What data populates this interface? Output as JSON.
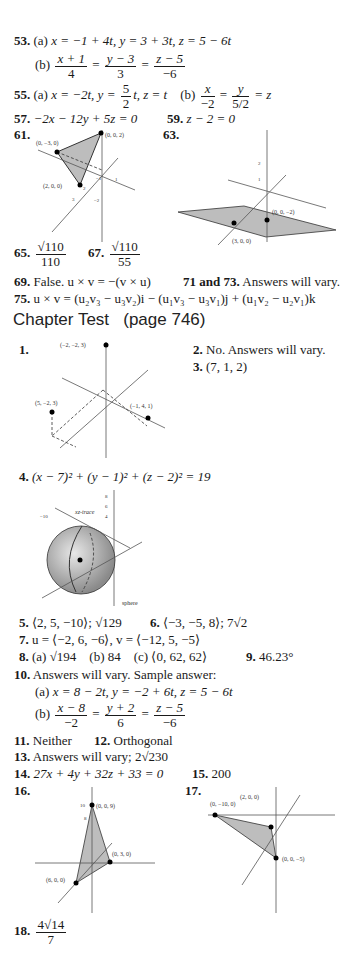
{
  "answers": {
    "a53": {
      "num": "53.",
      "a_label": "(a)",
      "a_text": "x = −1 + 4t,  y = 3 + 3t,  z = 5 − 6t",
      "b_label": "(b)",
      "b_fracs": [
        {
          "n": "x + 1",
          "d": "4"
        },
        {
          "n": "y − 3",
          "d": "3"
        },
        {
          "n": "z − 5",
          "d": "−6"
        }
      ]
    },
    "a55": {
      "num": "55.",
      "a_label": "(a)",
      "a_text1": "x = −2t,  y = ",
      "a_frac": {
        "n": "5",
        "d": "2"
      },
      "a_text2": "t,  z = t",
      "b_label": "(b)",
      "b_fracs": [
        {
          "n": "x",
          "d": "−2"
        },
        {
          "n": "y",
          "d": "5/2"
        }
      ],
      "b_tail": "= z"
    },
    "a57": {
      "num": "57.",
      "text": "−2x − 12y + 5z = 0"
    },
    "a59": {
      "num": "59.",
      "text": "z − 2 = 0"
    },
    "a61": {
      "num": "61.",
      "points": [
        "(0, −3, 0)",
        "(0, 0, 2)",
        "(2, 0, 0)"
      ],
      "ticks": [
        "1",
        "1",
        "−1",
        "2",
        "3",
        "−2"
      ]
    },
    "a63": {
      "num": "63.",
      "points": [
        "(0, 0, −2)",
        "(3, 0, 0)"
      ],
      "ticks": [
        "2",
        "1",
        "−2",
        "−1",
        "1",
        "1",
        "2",
        "−1",
        "3",
        "−2",
        "3",
        "4"
      ]
    },
    "a65": {
      "num": "65.",
      "n": "√110",
      "d": "110"
    },
    "a67": {
      "num": "67.",
      "n": "√110",
      "d": "55"
    },
    "a69": {
      "num": "69.",
      "text": "False. u × v = −(v × u)"
    },
    "a71": {
      "num": "71 and 73.",
      "text": "Answers will vary."
    },
    "a75": {
      "num": "75.",
      "text": "u × v = (u₂v₃ − u₃v₂)i − (u₁v₃ − u₃v₁)j + (u₁v₂ − u₂v₁)k"
    }
  },
  "chapter_test": {
    "heading": "Chapter Test",
    "page_ref": "(page 746)",
    "q1": {
      "num": "1.",
      "points": [
        "(−2, −2, 3)",
        "(5, −2, 3)",
        "(−1, 4, 1)"
      ],
      "ticks": [
        "4",
        "−2",
        "2",
        "2",
        "4",
        "4",
        "−4"
      ]
    },
    "q2": {
      "num": "2.",
      "text": "No. Answers will vary."
    },
    "q3": {
      "num": "3.",
      "text": "(7, 1, 2)"
    },
    "q4": {
      "num": "4.",
      "text": "(x − 7)² + (y − 1)² + (z − 2)² = 19",
      "labels": [
        "xz-trace",
        "sphere"
      ],
      "ticks": [
        "8",
        "6",
        "4",
        "−10",
        "−8",
        "−4",
        "−2",
        "2",
        "4",
        "6",
        "8",
        "12"
      ]
    },
    "q5": {
      "num": "5.",
      "text": "⟨2, 5, −10⟩; √129"
    },
    "q6": {
      "num": "6.",
      "text": "⟨−3, −5, 8⟩; 7√2"
    },
    "q7": {
      "num": "7.",
      "text": "u = ⟨−2, 6, −6⟩, v = ⟨−12, 5, −5⟩"
    },
    "q8": {
      "num": "8.",
      "a": "(a)  √194",
      "b": "(b)  84",
      "c": "(c)  ⟨0, 62, 62⟩"
    },
    "q9": {
      "num": "9.",
      "text": "46.23°"
    },
    "q10": {
      "num": "10.",
      "text": "Answers will vary. Sample answer:",
      "a_label": "(a)",
      "a_text": "x = 8 − 2t,  y = −2 + 6t,  z = 5 − 6t",
      "b_label": "(b)",
      "b_fracs": [
        {
          "n": "x − 8",
          "d": "−2"
        },
        {
          "n": "y + 2",
          "d": "6"
        },
        {
          "n": "z − 5",
          "d": "−6"
        }
      ]
    },
    "q11": {
      "num": "11.",
      "text": "Neither"
    },
    "q12": {
      "num": "12.",
      "text": "Orthogonal"
    },
    "q13": {
      "num": "13.",
      "text": "Answers will vary; 2√230"
    },
    "q14": {
      "num": "14.",
      "text": "27x + 4y + 32z + 33 = 0"
    },
    "q15": {
      "num": "15.",
      "text": "200"
    },
    "q16": {
      "num": "16.",
      "points": [
        "(0, 0, 9)",
        "(0, 3, 0)",
        "(6, 0, 0)"
      ],
      "ticks": [
        "10",
        "8",
        "−8",
        "−6",
        "−4",
        "4",
        "6",
        "8",
        "8",
        "−4",
        "−6"
      ]
    },
    "q17": {
      "num": "17.",
      "points": [
        "(2, 0, 0)",
        "(0, −10, 0)",
        "(0, 0, −5)"
      ],
      "ticks": [
        "6",
        "4",
        "2",
        "−6",
        "−10",
        "2",
        "4",
        "6",
        "4",
        "8",
        "10",
        "−6",
        "−8",
        "−10"
      ]
    },
    "q18": {
      "num": "18.",
      "n": "4√14",
      "d": "7"
    }
  }
}
